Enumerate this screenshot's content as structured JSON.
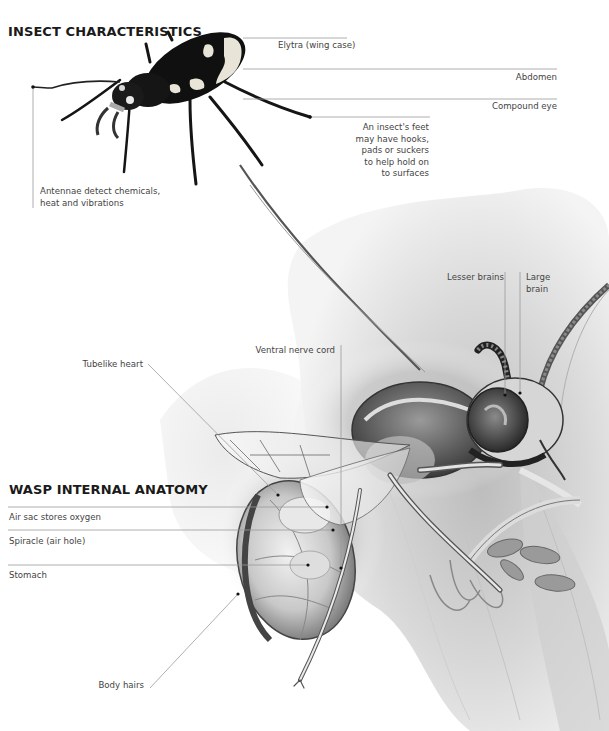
{
  "diagram": {
    "sections": [
      {
        "heading": "INSECT CHARACTERISTICS",
        "subject": "beetle",
        "labels": [
          {
            "id": "elytra",
            "text": "Elytra (wing case)"
          },
          {
            "id": "abdomen",
            "text": "Abdomen"
          },
          {
            "id": "compound-eye",
            "text": "Compound eye"
          },
          {
            "id": "feet",
            "text": "An insect's feet\nmay have hooks,\npads or suckers\nto help hold on\nto surfaces"
          },
          {
            "id": "antennae",
            "text": "Antennae detect chemicals,\nheat and vibrations"
          }
        ]
      },
      {
        "heading": "WASP INTERNAL ANATOMY",
        "subject": "wasp",
        "labels": [
          {
            "id": "lesser-brains",
            "text": "Lesser brains"
          },
          {
            "id": "large-brain",
            "text": "Large\nbrain"
          },
          {
            "id": "ventral-nerve-cord",
            "text": "Ventral nerve cord"
          },
          {
            "id": "tubelike-heart",
            "text": "Tubelike heart"
          },
          {
            "id": "air-sac",
            "text": "Air sac stores oxygen"
          },
          {
            "id": "spiracle",
            "text": "Spiracle (air hole)"
          },
          {
            "id": "stomach",
            "text": "Stomach"
          },
          {
            "id": "body-hairs",
            "text": "Body hairs"
          }
        ]
      }
    ],
    "colors": {
      "background": "#ffffff",
      "heading": "#1a1a1a",
      "label_text": "#444444",
      "leader_line": "#9a9a9a",
      "beetle_body": "#111111",
      "beetle_markings": "#e8e4d8",
      "flower": "#d9d9d9"
    }
  }
}
